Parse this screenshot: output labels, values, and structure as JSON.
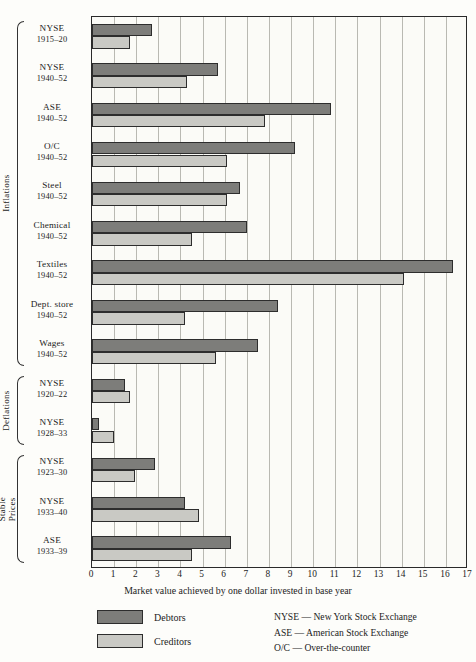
{
  "chart_data": {
    "type": "bar",
    "orientation": "horizontal",
    "title": "",
    "xlabel": "Market value achieved by one dollar invested in base year",
    "ylabel": "",
    "xlim": [
      0,
      17
    ],
    "xticks": [
      0,
      1,
      2,
      3,
      4,
      5,
      6,
      7,
      8,
      9,
      10,
      11,
      12,
      13,
      14,
      15,
      16,
      17
    ],
    "grid": true,
    "legend_position": "below-left",
    "series": [
      {
        "name": "Debtors",
        "color": "#7d7d7a",
        "values": [
          2.7,
          5.7,
          10.8,
          9.2,
          6.7,
          7.0,
          16.3,
          8.4,
          7.5,
          1.5,
          0.3,
          2.85,
          4.2,
          6.3
        ]
      },
      {
        "name": "Creditors",
        "color": "#c9c9c4",
        "values": [
          1.7,
          4.3,
          7.8,
          6.1,
          6.1,
          4.5,
          14.1,
          4.2,
          5.6,
          1.7,
          1.0,
          1.95,
          4.85,
          4.5
        ]
      }
    ],
    "categories": [
      {
        "name": "NYSE",
        "period": "1915–20",
        "group": "Inflations"
      },
      {
        "name": "NYSE",
        "period": "1940–52",
        "group": "Inflations"
      },
      {
        "name": "ASE",
        "period": "1940–52",
        "group": "Inflations"
      },
      {
        "name": "O/C",
        "period": "1940–52",
        "group": "Inflations"
      },
      {
        "name": "Steel",
        "period": "1940–52",
        "group": "Inflations"
      },
      {
        "name": "Chemical",
        "period": "1940–52",
        "group": "Inflations"
      },
      {
        "name": "Textiles",
        "period": "1940–52",
        "group": "Inflations"
      },
      {
        "name": "Dept. store",
        "period": "1940–52",
        "group": "Inflations"
      },
      {
        "name": "Wages",
        "period": "1940–52",
        "group": "Inflations"
      },
      {
        "name": "NYSE",
        "period": "1920–22",
        "group": "Deflations"
      },
      {
        "name": "NYSE",
        "period": "1928–33",
        "group": "Deflations"
      },
      {
        "name": "NYSE",
        "period": "1923–30",
        "group": "Stable Prices"
      },
      {
        "name": "NYSE",
        "period": "1933–40",
        "group": "Stable Prices"
      },
      {
        "name": "ASE",
        "period": "1933–39",
        "group": "Stable Prices"
      }
    ],
    "groups": [
      {
        "label": "Inflations",
        "first": 0,
        "last": 8
      },
      {
        "label": "Deflations",
        "first": 9,
        "last": 10
      },
      {
        "label": "Stable\nPrices",
        "first": 11,
        "last": 13
      }
    ]
  },
  "legend": {
    "entries": [
      {
        "label": "Debtors",
        "color": "#7d7d7a"
      },
      {
        "label": "Creditors",
        "color": "#c9c9c4"
      }
    ]
  },
  "abbreviations": [
    "NYSE — New York Stock Exchange",
    "ASE — American Stock Exchange",
    "O/C — Over-the-counter"
  ]
}
